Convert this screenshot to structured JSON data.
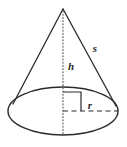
{
  "figure": {
    "name": "cone-diagram",
    "title": "Cone with height, radius and slant height",
    "shape": "cone",
    "background_color": "#ffffff",
    "stroke_color": "#2b2b2b",
    "label_color": "#2b2b2b"
  },
  "labels": {
    "slant_height": "s",
    "height": "h",
    "radius": "r"
  },
  "geometry": {
    "apex": {
      "x": 63,
      "y": 9
    },
    "base_center": {
      "x": 63,
      "y": 111
    },
    "base_ellipse": {
      "cx": 63,
      "cy": 111,
      "rx": 55,
      "ry": 24
    },
    "left_slant_end": {
      "x": 13,
      "y": 105
    },
    "right_slant_end": {
      "x": 116,
      "y": 106
    },
    "height_line": {
      "x1": 63,
      "y1": 9,
      "x2": 63,
      "y2": 111,
      "style": "dotted"
    },
    "radius_line": {
      "x1": 63,
      "y1": 111,
      "x2": 118,
      "y2": 111,
      "style": "dashed"
    },
    "right_angle_marker": {
      "x": 63,
      "y": 92,
      "size": 18
    }
  },
  "label_positions": {
    "slant_height": {
      "x": 95,
      "y": 52
    },
    "height": {
      "x": 71,
      "y": 70
    },
    "radius": {
      "x": 89,
      "y": 109
    }
  }
}
